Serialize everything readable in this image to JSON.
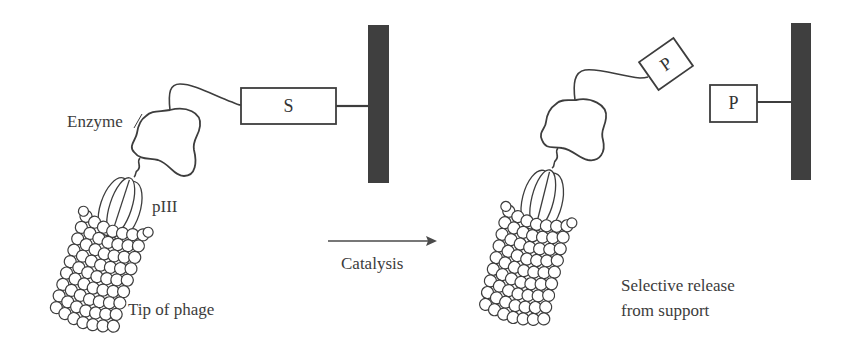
{
  "diagram": {
    "type": "phage-display-catalysis-selection",
    "colors": {
      "stroke": "#3d3d3d",
      "support": "#3f3f3f",
      "background": "#ffffff"
    },
    "left_panel": {
      "enzyme_label": "Enzyme",
      "piii_label": "pIII",
      "phage_label": "Tip of phage",
      "substrate_label": "S"
    },
    "arrow": {
      "label": "Catalysis"
    },
    "right_panel": {
      "product_attached_label": "P",
      "product_support_label": "P",
      "release_label_line1": "Selective release",
      "release_label_line2": "from support"
    }
  }
}
